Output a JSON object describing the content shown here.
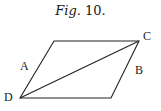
{
  "figure": {
    "caption_word": "Fig.",
    "caption_number": "10."
  },
  "diagram": {
    "shape": "parallelogram with diagonal",
    "stroke_color": "#222222",
    "vertices": {
      "top_left": [
        54,
        41
      ],
      "C": [
        139,
        41
      ],
      "bottom_right": [
        111,
        98
      ],
      "D": [
        20,
        98
      ]
    },
    "edges": [
      [
        "top_left",
        "C"
      ],
      [
        "C",
        "bottom_right"
      ],
      [
        "bottom_right",
        "D"
      ],
      [
        "D",
        "top_left"
      ]
    ],
    "diagonal": [
      "D",
      "C"
    ],
    "labels": [
      {
        "id": "A",
        "text": "A",
        "x": 20,
        "y": 60
      },
      {
        "id": "B",
        "text": "B",
        "x": 135,
        "y": 64
      },
      {
        "id": "C",
        "text": "C",
        "x": 143,
        "y": 30
      },
      {
        "id": "D",
        "text": "D",
        "x": 4,
        "y": 91
      }
    ]
  }
}
